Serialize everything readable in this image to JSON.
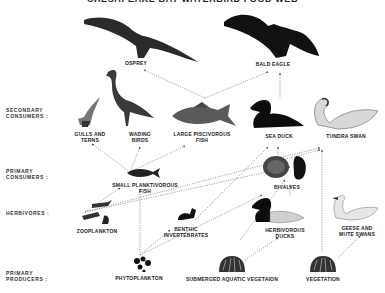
{
  "title": "CHESAPEAKE BAY WATERBIRD FOOD WEB",
  "levels": [
    {
      "id": "secondary",
      "label": "SECONDARY\nCONSUMERS :"
    },
    {
      "id": "primary",
      "label": "PRIMARY\nCONSUMERS :"
    },
    {
      "id": "herbivores",
      "label": "HERBIVORES :"
    },
    {
      "id": "producers",
      "label": "PRIMARY\nPRODUCERS :"
    }
  ],
  "organisms": {
    "osprey": "OSPREY",
    "bald_eagle": "BALD EAGLE",
    "gulls_terns": "GULLS AND\nTERNS",
    "wading_birds": "WADING\nBIRDS",
    "large_fish": "LARGE PISCIVOROUS\nFISH",
    "sea_duck": "SEA DUCK",
    "tundra_swan": "TUNDRA SWAN",
    "small_fish": "SMALL PLANKTIVOROUS\nFISH",
    "bivalves": "BIVALVES",
    "zooplankton": "ZOOPLANKTON",
    "benthic": "BENTHIC\nINVERTEBRATES",
    "herb_ducks": "HERBIVOROUS\nDUCKS",
    "geese_swans": "GEESE AND\nMUTE SWANS",
    "phytoplankton": "PHYTOPLANKTON",
    "sav": "SUBMERGED AQUATIC VEGETAION",
    "vegetation": "VEGETATION"
  },
  "colors": {
    "ink": "#1a1a1a",
    "line": "#555555",
    "bg": "#ffffff"
  }
}
